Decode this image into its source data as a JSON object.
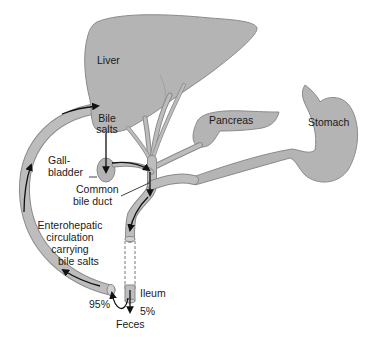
{
  "diagram": {
    "labels": {
      "liver": "Liver",
      "bile_salts_line1": "Bile",
      "bile_salts_line2": "salts",
      "pancreas": "Pancreas",
      "stomach": "Stomach",
      "gallbladder_line1": "Gall-",
      "gallbladder_line2": "bladder",
      "common_bile_duct_line1": "Common",
      "common_bile_duct_line2": "bile duct",
      "enterohepatic_line1": "Enterohepatic",
      "enterohepatic_line2": "circulation",
      "enterohepatic_line3": "carrying",
      "enterohepatic_line4": "bile salts",
      "ileum": "Ileum",
      "reabsorbed_percent": "95%",
      "excreted_percent": "5%",
      "feces": "Feces"
    },
    "colors": {
      "organ_fill": "#b4b4b4",
      "organ_outline": "#8a8a8a",
      "arrow": "#111111",
      "background": "#ffffff"
    }
  }
}
